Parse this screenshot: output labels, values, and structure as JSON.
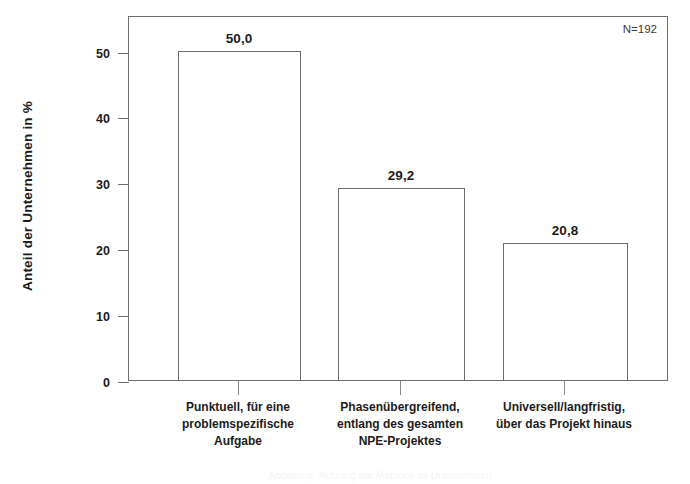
{
  "chart_data": {
    "type": "bar",
    "title": "",
    "subtitle": "",
    "xlabel": "",
    "ylabel": "Anteil der Unternehmen in %",
    "ylim": [
      0,
      55.4
    ],
    "yticks": [
      0,
      10,
      20,
      30,
      40,
      50
    ],
    "ytick_labels": [
      "0",
      "10",
      "20",
      "30",
      "40",
      "50"
    ],
    "grid": false,
    "legend": false,
    "categories": [
      "Punktuell, für eine problemspezifische Aufgabe",
      "Phasenübergreifend, entlang des gesamten NPE-Projektes",
      "Universell/langfristig, über das Projekt hinaus"
    ],
    "category_lines": [
      [
        "Punktuell, für eine",
        "problemspezifische",
        "Aufgabe"
      ],
      [
        "Phasenübergreifend,",
        "entlang des gesamten",
        "NPE-Projektes"
      ],
      [
        "Universell/langfristig,",
        "über das Projekt hinaus"
      ]
    ],
    "values": [
      50.0,
      29.2,
      20.8
    ],
    "value_labels": [
      "50,0",
      "29,2",
      "20,8"
    ],
    "annotations": [
      {
        "name": "sample-size",
        "text": "N=192"
      }
    ],
    "colors": {
      "bar_fill": "#ffffff",
      "bar_border": "#6b6b6b",
      "axis": "#6e6e6e",
      "text": "#1c1c1c"
    }
  },
  "annotation": {
    "sample_size": "N=192"
  },
  "caption": {
    "cut_off_text": "Abbildung: Nutzung der Methode im Unternehmen"
  }
}
